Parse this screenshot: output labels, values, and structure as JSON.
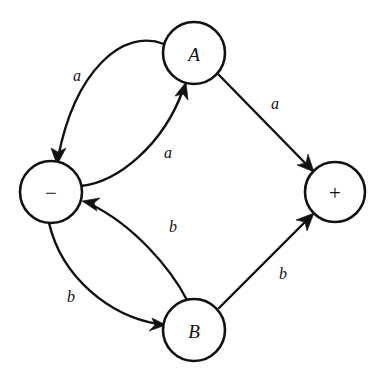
{
  "diagram": {
    "type": "state-transition-graph",
    "background_color": "#ffffff",
    "stroke_color": "#111111",
    "nodes": [
      {
        "id": "A",
        "label": "A",
        "cx": 194,
        "cy": 53,
        "r": 31
      },
      {
        "id": "minus",
        "label": "−",
        "cx": 51,
        "cy": 192,
        "r": 31
      },
      {
        "id": "plus",
        "label": "+",
        "cx": 335,
        "cy": 192,
        "r": 30
      },
      {
        "id": "B",
        "label": "B",
        "cx": 194,
        "cy": 330,
        "r": 31
      }
    ],
    "edges": [
      {
        "id": "a-to-minus",
        "from": "A",
        "to": "minus",
        "label": "a",
        "shape": "curve",
        "label_x": 77,
        "label_y": 75
      },
      {
        "id": "minus-to-a",
        "from": "minus",
        "to": "A",
        "label": "a",
        "shape": "curve",
        "label_x": 168,
        "label_y": 152
      },
      {
        "id": "a-to-plus",
        "from": "A",
        "to": "plus",
        "label": "a",
        "shape": "line",
        "label_x": 275,
        "label_y": 103
      },
      {
        "id": "b-to-minus",
        "from": "B",
        "to": "minus",
        "label": "b",
        "shape": "curve",
        "label_x": 173,
        "label_y": 226
      },
      {
        "id": "minus-to-b",
        "from": "minus",
        "to": "B",
        "label": "b",
        "shape": "curve",
        "label_x": 71,
        "label_y": 296
      },
      {
        "id": "b-to-plus",
        "from": "B",
        "to": "plus",
        "label": "b",
        "shape": "line",
        "label_x": 283,
        "label_y": 273
      }
    ]
  }
}
